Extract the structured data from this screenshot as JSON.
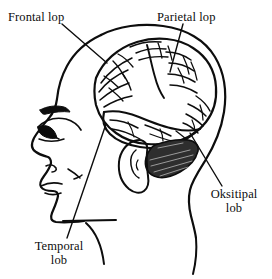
{
  "figure": {
    "orientation": "left-facing profile",
    "background_color": "#ffffff",
    "ink_color": "#0d0d0d",
    "width": 272,
    "height": 279
  },
  "labels": {
    "frontal": {
      "text": "Frontal lop",
      "lines": [
        "Frontal lop"
      ]
    },
    "parietal": {
      "text": "Parietal lop",
      "lines": [
        "Parietal lop"
      ]
    },
    "oksitipal": {
      "text": "Oksitipal lob",
      "line1": "Oksitipal",
      "line2": "lob"
    },
    "temporal": {
      "text": "Temporal lob",
      "line1": "Temporal",
      "line2": "lob"
    }
  },
  "parts": {
    "head_outline": "head-profile-outline",
    "brain": "cerebrum-gyri",
    "cerebellum": "cerebellum-hatched",
    "ear": "ear-outline",
    "eye": "eye",
    "eyebrow": "eyebrow",
    "nose": "nose",
    "lips": "lips",
    "chin": "chin",
    "neck": "neck"
  },
  "leader_lines": [
    {
      "name": "frontal",
      "from": [
        62,
        24
      ],
      "to": [
        107,
        63
      ]
    },
    {
      "name": "parietal",
      "from": [
        183,
        24
      ],
      "to": [
        170,
        72
      ]
    },
    {
      "name": "oksitipal",
      "from": [
        222,
        186
      ],
      "to": [
        190,
        133
      ]
    },
    {
      "name": "temporal",
      "from": [
        67,
        238
      ],
      "to": [
        106,
        124
      ]
    }
  ]
}
